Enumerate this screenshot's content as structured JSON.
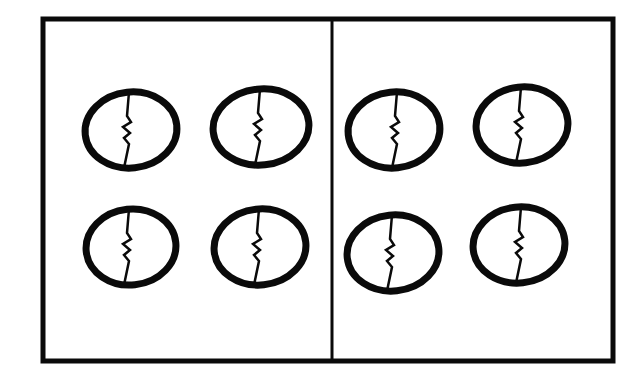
{
  "figure": {
    "groups": [
      {
        "label": "left-group",
        "eggs": [
          {
            "cx": 131,
            "cy": 130,
            "rx": 46,
            "ry": 38,
            "crack_x": 128
          },
          {
            "cx": 261,
            "cy": 127,
            "rx": 48,
            "ry": 38,
            "crack_x": 259
          },
          {
            "cx": 131,
            "cy": 247,
            "rx": 45,
            "ry": 38,
            "crack_x": 128
          },
          {
            "cx": 260,
            "cy": 247,
            "rx": 46,
            "ry": 38,
            "crack_x": 258
          }
        ]
      },
      {
        "label": "right-group",
        "eggs": [
          {
            "cx": 394,
            "cy": 130,
            "rx": 46,
            "ry": 38,
            "crack_x": 396
          },
          {
            "cx": 522,
            "cy": 125,
            "rx": 46,
            "ry": 38,
            "crack_x": 520
          },
          {
            "cx": 393,
            "cy": 253,
            "rx": 46,
            "ry": 38,
            "crack_x": 391
          },
          {
            "cx": 519,
            "cy": 245,
            "rx": 46,
            "ry": 38,
            "crack_x": 520
          }
        ]
      }
    ],
    "eggs_per_group": 4,
    "group_count": 2,
    "total_eggs": 8,
    "colors": {
      "ink": "#0a0a0a",
      "paper": "#ffffff"
    }
  }
}
